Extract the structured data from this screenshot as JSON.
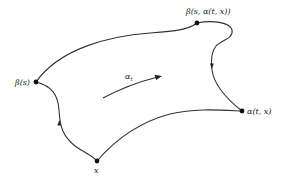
{
  "diagram": {
    "colors": {
      "stroke": "#333333",
      "text": "#222222",
      "background": "#ffffff"
    },
    "points": {
      "beta_s": {
        "label": "β(s)",
        "x": 36,
        "y": 82
      },
      "beta_s_alpha": {
        "label": "β(s, α(t, x))",
        "x": 197,
        "y": 23
      },
      "alpha_tx": {
        "label": "α(t, x)",
        "x": 242,
        "y": 111
      },
      "x": {
        "label": "x",
        "x": 97,
        "y": 161
      }
    },
    "flow_arrow": {
      "label": "α",
      "subscript": "t"
    },
    "edges": [
      {
        "from": "beta_s",
        "to": "beta_s_alpha",
        "arrow": false
      },
      {
        "from": "beta_s",
        "to": "x",
        "arrow": true
      },
      {
        "from": "x",
        "to": "alpha_tx",
        "arrow": false
      },
      {
        "from": "beta_s_alpha",
        "to": "alpha_tx",
        "arrow": true
      }
    ]
  }
}
